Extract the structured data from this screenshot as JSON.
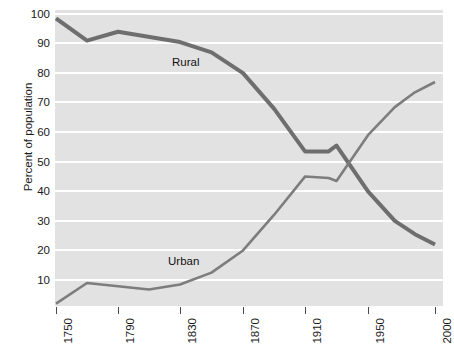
{
  "chart_data": {
    "type": "line",
    "title": "",
    "xlabel": "",
    "ylabel": "Percent of population",
    "xlim": [
      1750,
      2000
    ],
    "ylim": [
      0,
      100
    ],
    "yticks": [
      10,
      20,
      30,
      40,
      50,
      60,
      70,
      80,
      90,
      100
    ],
    "xticks": [
      1750,
      1790,
      1830,
      1870,
      1910,
      1950,
      2000
    ],
    "grid": "horizontal-white",
    "legend": "inline-annotations",
    "series": [
      {
        "name": "Rural",
        "color": "#6e6e6e",
        "x": [
          1750,
          1770,
          1790,
          1830,
          1850,
          1870,
          1890,
          1910,
          1925,
          1930,
          1950,
          1970,
          1985,
          2000
        ],
        "values": [
          98.5,
          91.0,
          94.0,
          90.5,
          87.0,
          80.0,
          68.0,
          53.5,
          53.5,
          55.5,
          40.0,
          30.0,
          25.5,
          22.0
        ]
      },
      {
        "name": "Urban",
        "color": "#7d7d7d",
        "x": [
          1750,
          1770,
          1810,
          1830,
          1850,
          1870,
          1890,
          1910,
          1925,
          1930,
          1950,
          1970,
          1985,
          2000
        ],
        "values": [
          2.0,
          9.0,
          6.8,
          8.5,
          12.5,
          20.0,
          32.0,
          45.0,
          44.5,
          43.5,
          59.0,
          68.5,
          73.5,
          77.0
        ]
      }
    ]
  },
  "axes": {
    "ylabel": "Percent of population",
    "yticklabels": [
      "100",
      "90",
      "80",
      "70",
      "60",
      "50",
      "40",
      "30",
      "20",
      "10"
    ],
    "xticklabels": [
      "1750",
      "1790",
      "1830",
      "1870",
      "1910",
      "1950",
      "2000"
    ]
  },
  "annotations": {
    "rural": "Rural",
    "urban": "Urban"
  }
}
